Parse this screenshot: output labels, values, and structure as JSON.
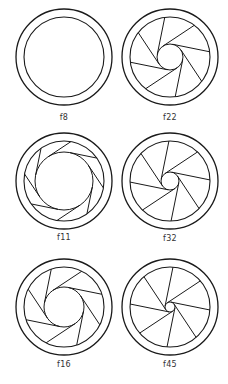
{
  "diagram": {
    "stroke_color": "#1a1a1a",
    "irises": [
      {
        "label": "f8",
        "cx": 64,
        "cy": 57,
        "outer_r": 48,
        "ring_r": 40,
        "aperture_r": 40,
        "blades": 0
      },
      {
        "label": "f22",
        "cx": 170,
        "cy": 57,
        "outer_r": 48,
        "ring_r": 40,
        "aperture_r": 13,
        "blades": 8
      },
      {
        "label": "f11",
        "cx": 64,
        "cy": 181,
        "outer_r": 48,
        "ring_r": 40,
        "aperture_r": 29,
        "blades": 8
      },
      {
        "label": "f32",
        "cx": 170,
        "cy": 181,
        "outer_r": 48,
        "ring_r": 40,
        "aperture_r": 9,
        "blades": 8
      },
      {
        "label": "f16",
        "cx": 64,
        "cy": 307,
        "outer_r": 48,
        "ring_r": 40,
        "aperture_r": 20,
        "blades": 8
      },
      {
        "label": "f45",
        "cx": 170,
        "cy": 307,
        "outer_r": 48,
        "ring_r": 40,
        "aperture_r": 5,
        "blades": 8
      }
    ]
  }
}
